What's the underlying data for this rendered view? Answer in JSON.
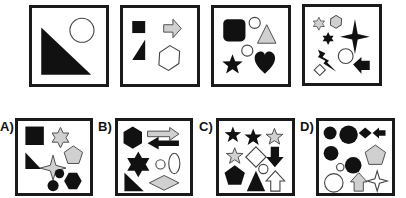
{
  "puzzle": {
    "colors": {
      "black": "#111111",
      "grey": "#d0d0d0",
      "white": "#ffffff",
      "stroke": "#444444"
    },
    "sequence": [
      {
        "index": 1,
        "shapes": [
          "black right triangle",
          "white circle"
        ]
      },
      {
        "index": 2,
        "shapes": [
          "black square",
          "grey arrow right",
          "black trapezoid",
          "white hexagon"
        ]
      },
      {
        "index": 3,
        "shapes": [
          "black rounded square",
          "white circle",
          "grey triangle",
          "white circle",
          "black star",
          "black heart"
        ]
      },
      {
        "index": 4,
        "shapes": [
          "grey six-point star",
          "grey hexagon",
          "black six-point star",
          "black four-point star",
          "black lightning bolt",
          "white circle",
          "white diamond",
          "black arrow left"
        ]
      }
    ],
    "options": [
      {
        "label": "A)",
        "shapes": [
          "black square",
          "grey six-point star",
          "grey pentagon",
          "black right triangle",
          "grey four-point star",
          "black circle",
          "black circle",
          "black hexagon"
        ]
      },
      {
        "label": "B)",
        "shapes": [
          "black hexagon",
          "grey arrow right",
          "black arrow left",
          "black six-point star",
          "white circle",
          "white ellipse",
          "black right triangle",
          "grey diamond"
        ]
      },
      {
        "label": "C)",
        "shapes": [
          "black star",
          "black star",
          "grey star",
          "grey star",
          "white diamond",
          "black arrow down",
          "white circle",
          "black pentagon",
          "black triangle",
          "white arrow up"
        ]
      },
      {
        "label": "D)",
        "shapes": [
          "black circle",
          "black circle",
          "black diamond",
          "black arrow left",
          "black circle",
          "grey pentagon",
          "white circle",
          "black circle",
          "white circle",
          "grey arrow up",
          "white four-point star"
        ]
      }
    ]
  }
}
